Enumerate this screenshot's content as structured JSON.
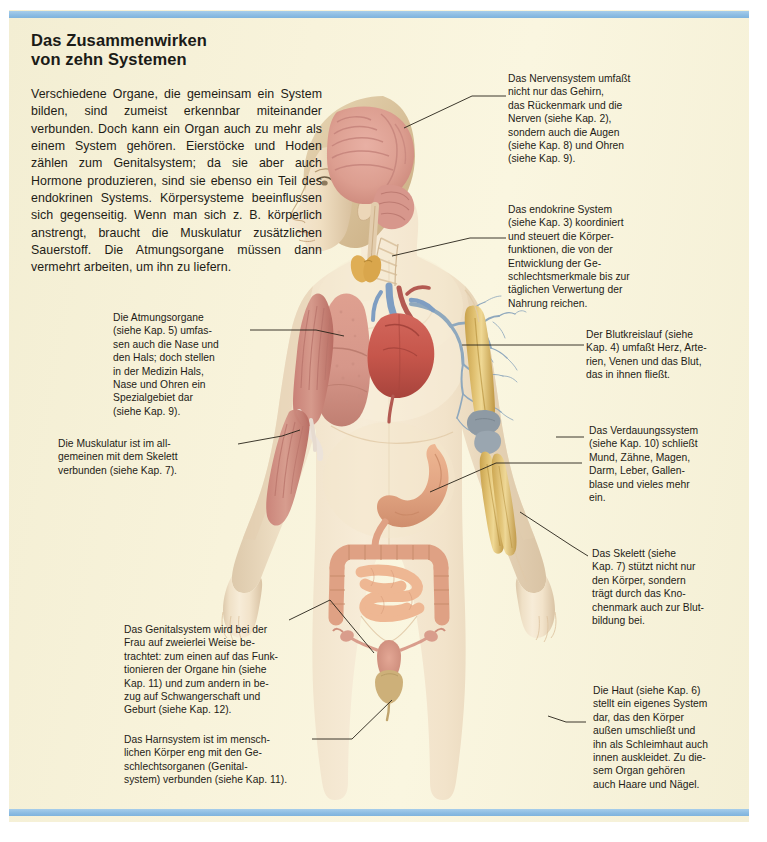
{
  "page": {
    "background_color": "#f6f1d8",
    "rule_color": "#8dbde3"
  },
  "headline": {
    "line1": "Das Zusammenwirken",
    "line2": "von zehn Systemen"
  },
  "intro": {
    "text": "Verschiedene Organe, die gemeinsam ein System bilden, sind zumeist erkennbar miteinander verbunden. Doch kann ein Organ auch zu mehr als einem System gehören. Eierstöcke und Hoden zählen zum Genitalsystem; da sie aber auch Hormone produzieren, sind sie ebenso ein Teil des endokrinen Systems. Körpersysteme beeinflussen sich gegenseitig. Wenn man sich z. B. körperlich anstrengt, braucht die Muskulatur zusätzlichen Sauerstoff. Die Atmungsorgane müssen dann vermehrt arbeiten, um ihn zu liefern."
  },
  "callouts": [
    {
      "id": "nervensystem",
      "name": "callout-nervous-system",
      "lines": [
        "Das Nervensystem umfaßt",
        "nicht nur das Gehirn,",
        "das Rückenmark und die",
        "Nerven (siehe Kap. 2),",
        "sondern auch die Augen",
        "(siehe Kap. 8) und Ohren",
        "(siehe Kap. 9)."
      ]
    },
    {
      "id": "endokrin",
      "name": "callout-endocrine-system",
      "lines": [
        "Das endokrine System",
        "(siehe Kap. 3) koordiniert",
        "und steuert die Körper-",
        "funktionen, die von der",
        "Entwicklung der Ge-",
        "schlechtsmerkmale bis zur",
        "täglichen Verwertung der",
        "Nahrung reichen."
      ]
    },
    {
      "id": "blutkreislauf",
      "name": "callout-circulatory-system",
      "lines": [
        "Der Blutkreislauf (siehe",
        "Kap. 4) umfaßt Herz, Arte-",
        "rien, Venen und das Blut,",
        "das in ihnen fließt."
      ]
    },
    {
      "id": "atmung",
      "name": "callout-respiratory-system",
      "lines": [
        "Die Atmungsorgane",
        "(siehe Kap. 5) umfas-",
        "sen auch die Nase und",
        "den Hals; doch stellen",
        "in der Medizin Hals,",
        "Nase und Ohren ein",
        "Spezialgebiet dar",
        "(siehe Kap. 9)."
      ]
    },
    {
      "id": "muskulatur",
      "name": "callout-muscular-system",
      "lines": [
        "Die Muskulatur ist im all-",
        "gemeinen mit dem Skelett",
        "verbunden (siehe Kap. 7)."
      ]
    },
    {
      "id": "verdauung",
      "name": "callout-digestive-system",
      "lines": [
        "Das Verdauungssystem",
        "(siehe Kap. 10) schließt",
        "Mund, Zähne, Magen,",
        "Darm, Leber, Gallen-",
        "blase und vieles mehr",
        "ein."
      ]
    },
    {
      "id": "skelett",
      "name": "callout-skeletal-system",
      "lines": [
        "Das Skelett (siehe",
        "Kap. 7) stützt nicht nur",
        "den Körper, sondern",
        "trägt durch das Kno-",
        "chenmark auch zur Blut-",
        "bildung bei."
      ]
    },
    {
      "id": "haut",
      "name": "callout-integumentary-system",
      "lines": [
        "Die Haut (siehe Kap. 6)",
        "stellt ein eigenes System",
        "dar, das den Körper",
        "außen umschließt und",
        "ihn als Schleimhaut auch",
        "innen auskleidet. Zu die-",
        "sem Organ gehören",
        "auch Haare und Nägel."
      ]
    },
    {
      "id": "genital",
      "name": "callout-genital-system",
      "lines": [
        "Das Genitalsystem wird bei der",
        "Frau auf zweierlei Weise be-",
        "trachtet: zum einen auf das Funk-",
        "tionieren der Organe hin (siehe",
        "Kap. 11) und zum andern in be-",
        "zug auf Schwangerschaft und",
        "Geburt (siehe Kap. 12)."
      ]
    },
    {
      "id": "harn",
      "name": "callout-urinary-system",
      "lines": [
        "Das Harnsystem ist im mensch-",
        "lichen Körper eng mit den Ge-",
        "schlechtsorganen (Genital-",
        "system) verbunden (siehe Kap. 11)."
      ]
    }
  ],
  "illustration": {
    "name": "human-anatomy-figure",
    "description": "Anatomische Darstellung einer weiblichen Figur mit zehn Körpersystemen",
    "organs": [
      "Gehirn",
      "Rückenmark",
      "Schilddrüse",
      "Lunge",
      "Herz",
      "Bronchien",
      "Magen",
      "Dickdarm",
      "Dünndarm",
      "Gebärmutter",
      "Eierstöcke",
      "Harnblase",
      "Oberarmknochen",
      "Elle",
      "Speiche",
      "Armmuskulatur"
    ]
  }
}
